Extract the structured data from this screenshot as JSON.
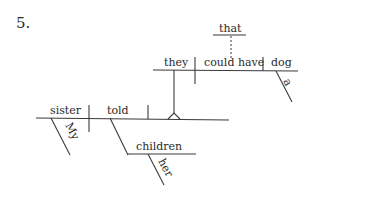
{
  "exercise": {
    "number": "5."
  },
  "diagram": {
    "main_clause": {
      "subject": "sister",
      "subject_modifier": "My",
      "verb": "told",
      "indirect_object": "children",
      "indirect_object_modifier": "her"
    },
    "noun_clause": {
      "subject": "they",
      "verb": "could have",
      "object": "dog",
      "object_modifier": "a",
      "connector": "that"
    }
  }
}
